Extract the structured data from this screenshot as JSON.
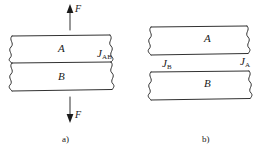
{
  "figure": {
    "background_color": "#ffffff",
    "line_color": "#1a1a1a",
    "panels": [
      {
        "id": "a",
        "caption": "a)",
        "bars": [
          {
            "id": "bar-a",
            "material_label": "A"
          },
          {
            "id": "bar-b",
            "material_label": "B"
          }
        ],
        "flux_labels": [
          {
            "id": "j-ab",
            "symbol": "J",
            "subscript": "AB"
          }
        ],
        "force_arrows": [
          {
            "id": "force-top",
            "symbol": "F",
            "direction": "up"
          },
          {
            "id": "force-bottom",
            "symbol": "F",
            "direction": "down"
          }
        ]
      },
      {
        "id": "b",
        "caption": "b)",
        "bars": [
          {
            "id": "bar-a",
            "material_label": "A"
          },
          {
            "id": "bar-b",
            "material_label": "B"
          }
        ],
        "flux_labels": [
          {
            "id": "j-a",
            "symbol": "J",
            "subscript": "A"
          },
          {
            "id": "j-b",
            "symbol": "J",
            "subscript": "B"
          }
        ],
        "force_arrows": []
      }
    ]
  }
}
